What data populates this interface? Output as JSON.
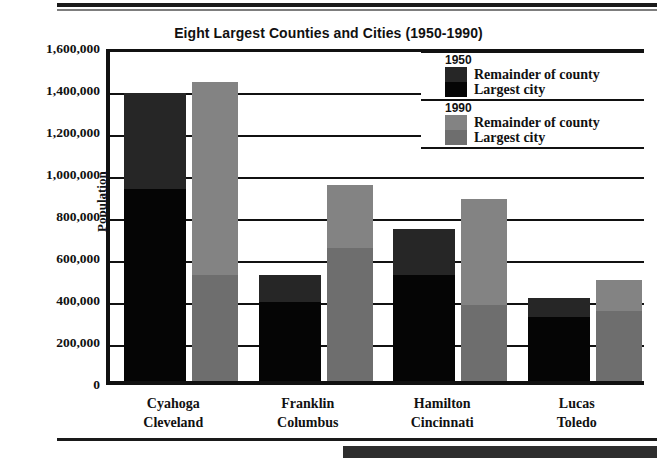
{
  "chart_data": {
    "type": "bar",
    "subtype": "stacked-grouped",
    "title": "Eight Largest Counties and Cities (1950-1990)",
    "xlabel": "",
    "ylabel": "Population",
    "ylim": [
      0,
      1600000
    ],
    "ytick_step": 200000,
    "ytick_labels": [
      "1,600,000",
      "1,400,000",
      "1,200,000",
      "1,000,000",
      "800,000",
      "600,000",
      "400,000",
      "200,000",
      "0"
    ],
    "ytick_values": [
      1600000,
      1400000,
      1200000,
      1000000,
      800000,
      600000,
      400000,
      200000,
      0
    ],
    "grid": true,
    "legend_position": "top-right-inside",
    "categories": [
      {
        "county": "Cyahoga",
        "city": "Cleveland"
      },
      {
        "county": "Franklin",
        "city": "Columbus"
      },
      {
        "county": "Hamilton",
        "city": "Cincinnati"
      },
      {
        "county": "Lucas",
        "city": "Toledo"
      }
    ],
    "series": [
      {
        "name": "1950 Largest city",
        "year": "1950",
        "part": "Largest city",
        "color": "#050505",
        "values": [
          915000,
          375000,
          503000,
          304000
        ]
      },
      {
        "name": "1950 Remainder of county",
        "year": "1950",
        "part": "Remainder of county",
        "color": "#262626",
        "values": [
          455000,
          128000,
          220000,
          92000
        ]
      },
      {
        "name": "1990 Largest city",
        "year": "1990",
        "part": "Largest city",
        "color": "#6e6e6e",
        "values": [
          505000,
          633000,
          364000,
          333000
        ]
      },
      {
        "name": "1990 Remainder of county",
        "year": "1990",
        "part": "Remainder of county",
        "color": "#838383",
        "values": [
          917000,
          300000,
          502000,
          150000
        ]
      }
    ],
    "totals_1950": [
      1370000,
      503000,
      723000,
      396000
    ],
    "totals_1990": [
      1422000,
      933000,
      866000,
      483000
    ]
  },
  "legend": {
    "groups": [
      {
        "year": "1950",
        "rows": [
          {
            "label": "Remainder of county",
            "color": "#262626"
          },
          {
            "label": "Largest city",
            "color": "#050505"
          }
        ]
      },
      {
        "year": "1990",
        "rows": [
          {
            "label": "Remainder of county",
            "color": "#838383"
          },
          {
            "label": "Largest city",
            "color": "#6e6e6e"
          }
        ]
      }
    ]
  }
}
